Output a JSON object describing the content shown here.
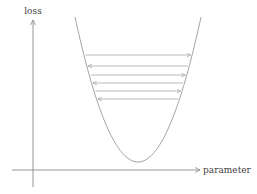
{
  "diagram": {
    "colors": {
      "axis": "#8a8a8a",
      "curve": "#9a9a9a",
      "arrow": "#a8a8a8",
      "label": "#444444",
      "background": "#ffffff"
    },
    "y_axis": {
      "label": "loss",
      "x": 33,
      "y_top": 20,
      "y_bottom": 187
    },
    "x_axis": {
      "label": "parameter",
      "y": 170,
      "x_left": 12,
      "x_right": 200
    },
    "curve": {
      "type": "parabola",
      "vertex": [
        138,
        162
      ],
      "left_top": [
        75,
        17
      ],
      "right_top": [
        201,
        17
      ]
    },
    "steps": [
      {
        "y": 55,
        "direction": "right"
      },
      {
        "y": 66,
        "direction": "left"
      },
      {
        "y": 75,
        "direction": "right"
      },
      {
        "y": 83,
        "direction": "left"
      },
      {
        "y": 91,
        "direction": "right"
      },
      {
        "y": 99,
        "direction": "left"
      }
    ]
  }
}
